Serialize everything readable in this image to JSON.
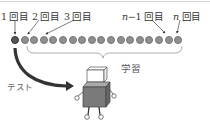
{
  "labels": {
    "first": "1 回目",
    "second": "2 回目",
    "third": "3 回目",
    "n_minus_1_var": "n",
    "n_minus_1_rest": "−1 回目",
    "n_var": "n",
    "n_rest": " 回目",
    "learning": "学習",
    "test": "テスト"
  },
  "dots": {
    "count": 18,
    "first_color": "#555555",
    "rest_color": "#8e8e8e"
  }
}
